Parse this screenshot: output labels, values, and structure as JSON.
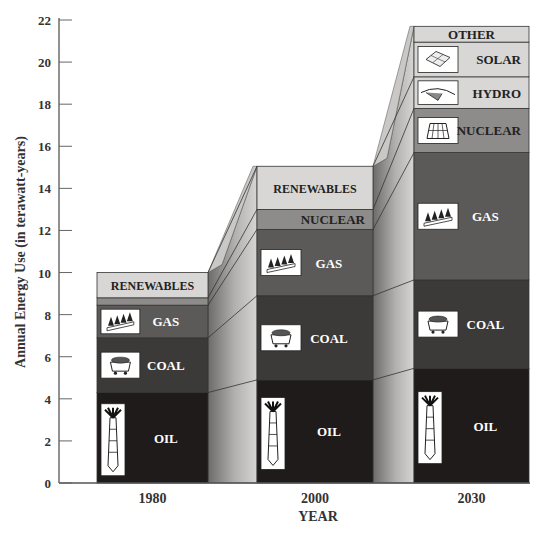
{
  "chart_data": {
    "type": "bar",
    "subtype": "stacked-3d",
    "title": "",
    "xlabel": "YEAR",
    "ylabel": "Annual Energy Use (in terawatt-years)",
    "ylim": [
      0,
      22
    ],
    "yticks": [
      0,
      2,
      4,
      6,
      8,
      10,
      12,
      14,
      16,
      18,
      20,
      22
    ],
    "grid": false,
    "legend": "inline labels on segments",
    "categories": [
      "1980",
      "2000",
      "2030"
    ],
    "bars": [
      {
        "category": "1980",
        "segments": [
          {
            "name": "OIL",
            "bottom": 0,
            "top": 4.3,
            "color": "#1e1b1a",
            "text_color": "#ffffff",
            "icon": "oil-derrick-icon"
          },
          {
            "name": "COAL",
            "bottom": 4.3,
            "top": 6.9,
            "color": "#3c3a39",
            "text_color": "#ffffff",
            "icon": "coal-cart-icon"
          },
          {
            "name": "GAS",
            "bottom": 6.9,
            "top": 8.45,
            "color": "#5c5a59",
            "text_color": "#ffffff",
            "icon": "gas-flames-icon"
          },
          {
            "name": "",
            "bottom": 8.45,
            "top": 8.8,
            "color": "#8e8c8b",
            "text_color": "#222222",
            "icon": ""
          },
          {
            "name": "RENEWABLES",
            "bottom": 8.8,
            "top": 10.0,
            "color": "#d8d7d6",
            "text_color": "#222222",
            "icon": ""
          }
        ],
        "total": 10.0
      },
      {
        "category": "2000",
        "segments": [
          {
            "name": "OIL",
            "bottom": 0,
            "top": 4.9,
            "color": "#1e1b1a",
            "text_color": "#ffffff",
            "icon": "oil-derrick-icon"
          },
          {
            "name": "COAL",
            "bottom": 4.9,
            "top": 8.9,
            "color": "#3c3a39",
            "text_color": "#ffffff",
            "icon": "coal-cart-icon"
          },
          {
            "name": "GAS",
            "bottom": 8.9,
            "top": 12.05,
            "color": "#5c5a59",
            "text_color": "#ffffff",
            "icon": "gas-flames-icon"
          },
          {
            "name": "NUCLEAR",
            "bottom": 12.05,
            "top": 13.0,
            "color": "#8e8c8b",
            "text_color": "#222222",
            "icon": ""
          },
          {
            "name": "RENEWABLES",
            "bottom": 13.0,
            "top": 15.05,
            "color": "#d8d7d6",
            "text_color": "#222222",
            "icon": ""
          }
        ],
        "total": 15.05
      },
      {
        "category": "2030",
        "segments": [
          {
            "name": "OIL",
            "bottom": 0,
            "top": 5.45,
            "color": "#1e1b1a",
            "text_color": "#ffffff",
            "icon": "oil-derrick-icon"
          },
          {
            "name": "COAL",
            "bottom": 5.45,
            "top": 9.65,
            "color": "#3c3a39",
            "text_color": "#ffffff",
            "icon": "coal-cart-icon"
          },
          {
            "name": "GAS",
            "bottom": 9.65,
            "top": 15.7,
            "color": "#5c5a59",
            "text_color": "#ffffff",
            "icon": "gas-flames-icon"
          },
          {
            "name": "NUCLEAR",
            "bottom": 15.7,
            "top": 17.8,
            "color": "#8e8c8b",
            "text_color": "#222222",
            "icon": "cooling-tower-icon"
          },
          {
            "name": "HYDRO",
            "bottom": 17.8,
            "top": 19.3,
            "color": "#d8d7d6",
            "text_color": "#222222",
            "icon": "dam-icon"
          },
          {
            "name": "SOLAR",
            "bottom": 19.3,
            "top": 20.95,
            "color": "#d8d7d6",
            "text_color": "#222222",
            "icon": "solar-panel-icon"
          },
          {
            "name": "OTHER",
            "bottom": 20.95,
            "top": 21.7,
            "color": "#d8d7d6",
            "text_color": "#222222",
            "icon": ""
          }
        ],
        "total": 21.7
      }
    ]
  }
}
